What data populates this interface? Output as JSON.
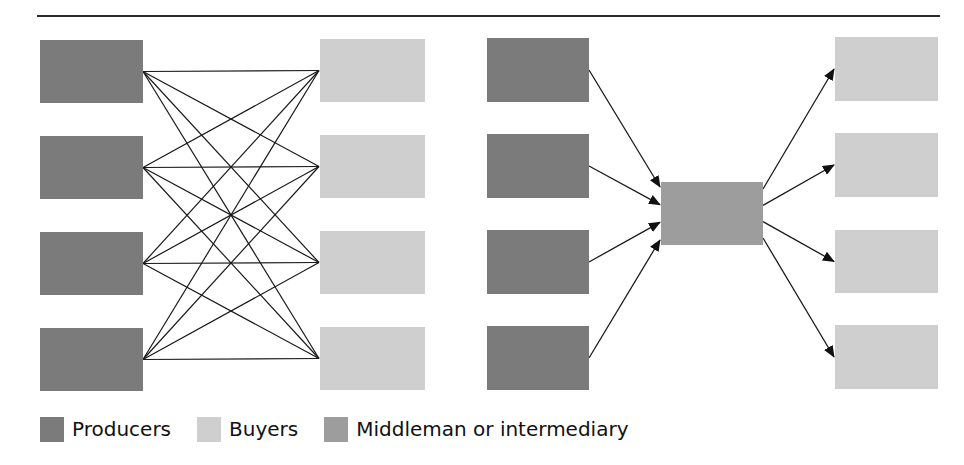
{
  "colors": {
    "producer": "#7b7b7b",
    "buyer": "#cfcfcf",
    "middleman": "#9d9d9d",
    "line": "#1a1a1a"
  },
  "diagrams": [
    {
      "name": "direct-exchange",
      "producers": [
        {
          "x": 40,
          "y": 40,
          "w": 103,
          "h": 63
        },
        {
          "x": 40,
          "y": 136,
          "w": 103,
          "h": 63
        },
        {
          "x": 40,
          "y": 232,
          "w": 103,
          "h": 63
        },
        {
          "x": 40,
          "y": 328,
          "w": 103,
          "h": 63
        }
      ],
      "buyers": [
        {
          "x": 320,
          "y": 39,
          "w": 105,
          "h": 63
        },
        {
          "x": 320,
          "y": 135,
          "w": 105,
          "h": 63
        },
        {
          "x": 320,
          "y": 231,
          "w": 105,
          "h": 63
        },
        {
          "x": 320,
          "y": 327,
          "w": 105,
          "h": 63
        }
      ],
      "connections": "every producer connects to every buyer (16 lines)"
    },
    {
      "name": "intermediated-exchange",
      "producers": [
        {
          "x": 487,
          "y": 38,
          "w": 102,
          "h": 64
        },
        {
          "x": 487,
          "y": 134,
          "w": 102,
          "h": 64
        },
        {
          "x": 487,
          "y": 230,
          "w": 102,
          "h": 64
        },
        {
          "x": 487,
          "y": 326,
          "w": 102,
          "h": 64
        }
      ],
      "middleman": {
        "x": 661,
        "y": 182,
        "w": 102,
        "h": 63
      },
      "buyers": [
        {
          "x": 835,
          "y": 37,
          "w": 103,
          "h": 64
        },
        {
          "x": 835,
          "y": 133,
          "w": 103,
          "h": 64
        },
        {
          "x": 835,
          "y": 230,
          "w": 103,
          "h": 63
        },
        {
          "x": 835,
          "y": 325,
          "w": 103,
          "h": 64
        }
      ],
      "connections": "producers -> middleman -> buyers (arrows)"
    }
  ],
  "legend": [
    {
      "label": "Producers",
      "key": "producer"
    },
    {
      "label": "Buyers",
      "key": "buyer"
    },
    {
      "label": "Middleman or intermediary",
      "key": "middleman"
    }
  ]
}
